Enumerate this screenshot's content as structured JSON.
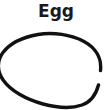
{
  "canvas": {
    "width": 112,
    "height": 110,
    "background_color": "#ffffff"
  },
  "label": {
    "text": "Egg",
    "color": "#1a1a1a"
  },
  "drawing": {
    "name": "egg-outline",
    "kind": "hand-drawn-oval",
    "stroke_color": "#111111",
    "fill_color": "none",
    "stroke_width": 3.4,
    "cropped_edges": "left, bottom, right",
    "path": "M 100.5 70.5 C 101.8 58.5 96.0 48.0 84.0 41.5 C 71.0 34.5 53.0 31.8 38.0 34.5 C 22.5 37.2 9.5 44.0 3.0 52.5 C -3.5 61.0 -3.0 71.5 3.5 80.5 C 10.5 90.5 26.0 99.5 43.0 104.0 C 58.0 108.0 72.0 108.5 82.0 105.0 C 90.5 102.0 96.0 94.5 98.5 85.0"
  }
}
